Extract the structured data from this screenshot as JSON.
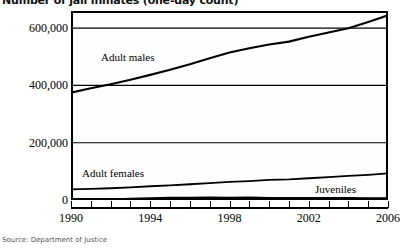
{
  "title": "Number of jail inmates (one-day count)",
  "source": "Source: Department of Justice",
  "labels": {
    "adult_males": "Adult males",
    "adult_females": "Adult females",
    "juveniles": "Juveniles"
  },
  "axis": {
    "y_ticks": [
      "0",
      "200,000",
      "400,000",
      "600,000"
    ],
    "x_ticks": [
      "1990",
      "1994",
      "1998",
      "2002",
      "2006"
    ]
  },
  "colors": {
    "line": "#000000",
    "frame": "#000000",
    "background": "#ffffff",
    "source_text": "#555555"
  },
  "chart_data": {
    "type": "line",
    "title": "Number of jail inmates (one-day count)",
    "xlabel": "",
    "ylabel": "",
    "xlim": [
      1990,
      2006
    ],
    "ylim": [
      0,
      660000
    ],
    "grid": true,
    "legend": "inline-labels",
    "x": [
      1990,
      1991,
      1992,
      1993,
      1994,
      1995,
      1996,
      1997,
      1998,
      1999,
      2000,
      2001,
      2002,
      2003,
      2004,
      2005,
      2006
    ],
    "series": [
      {
        "name": "Adult males",
        "values": [
          375000,
          390000,
          404000,
          420000,
          437000,
          455000,
          474000,
          495000,
          515000,
          530000,
          543000,
          553000,
          570000,
          585000,
          600000,
          622000,
          645000
        ]
      },
      {
        "name": "Adult females",
        "values": [
          37000,
          39000,
          41000,
          44000,
          48000,
          51000,
          55000,
          59000,
          63000,
          66000,
          70000,
          72000,
          76000,
          80000,
          84000,
          88000,
          93000
        ]
      },
      {
        "name": "Juveniles",
        "values": [
          2300,
          2350,
          2400,
          4300,
          6700,
          7800,
          8100,
          9100,
          8100,
          9500,
          7600,
          7600,
          7200,
          6900,
          7100,
          6800,
          6100
        ]
      }
    ],
    "y_tick_values": [
      0,
      200000,
      400000,
      600000
    ],
    "x_tick_values": [
      1990,
      1994,
      1998,
      2002,
      2006
    ]
  }
}
